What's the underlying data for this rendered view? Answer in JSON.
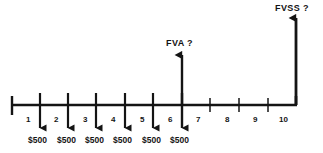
{
  "diagram": {
    "type": "timeline-cash-flow",
    "title_visible": false,
    "colors": {
      "line": "#141414",
      "text": "#141414",
      "background": "#ffffff"
    },
    "axis": {
      "name": "time-line",
      "start_label": "0",
      "end_label": "10",
      "x_start": 11,
      "x_end": 297,
      "y": 105
    },
    "period_labels": [
      "1",
      "2",
      "3",
      "4",
      "5",
      "6",
      "7",
      "8",
      "9",
      "10"
    ],
    "cash_flows": [
      {
        "period": "1",
        "amount": "$500",
        "direction": "outflow"
      },
      {
        "period": "2",
        "amount": "$500",
        "direction": "outflow"
      },
      {
        "period": "3",
        "amount": "$500",
        "direction": "outflow"
      },
      {
        "period": "4",
        "amount": "$500",
        "direction": "outflow"
      },
      {
        "period": "5",
        "amount": "$500",
        "direction": "outflow"
      },
      {
        "period": "6",
        "amount": "$500",
        "direction": "outflow"
      }
    ],
    "annotations": [
      {
        "name": "fva-annotation",
        "label": "FVA ?",
        "at_period": "6",
        "direction": "up"
      },
      {
        "name": "fvss-annotation",
        "label": "FVSS ?",
        "at_period": "10",
        "direction": "up"
      }
    ]
  }
}
